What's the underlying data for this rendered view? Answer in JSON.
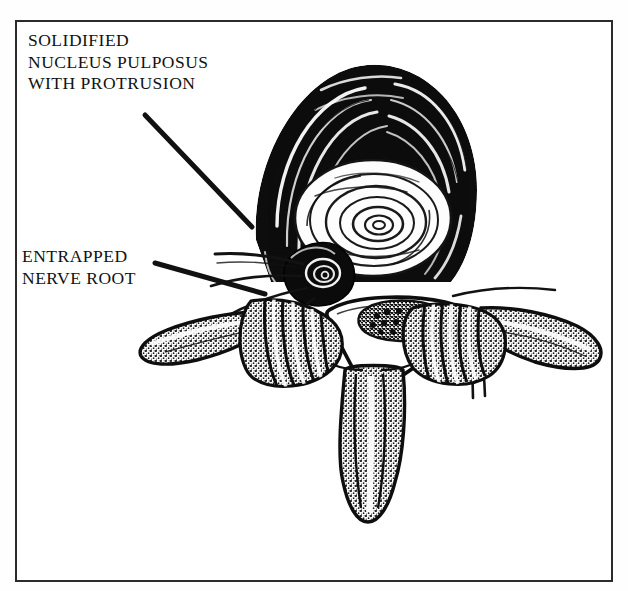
{
  "figure": {
    "type": "medical-illustration",
    "view": "superior / axial",
    "background_color": "#ffffff",
    "ink_color": "#111111",
    "border_color": "#2b2b2b",
    "has_border_frame": true
  },
  "labels": {
    "solidified": {
      "text": "SOLIDIFIED\nNUCLEUS PULPOSUS\nWITH PROTRUSION",
      "lines": [
        "SOLIDIFIED",
        "NUCLEUS PULPOSUS",
        "WITH PROTRUSION"
      ],
      "leader_from": [
        145,
        95
      ],
      "leader_to": [
        252,
        207
      ]
    },
    "entrapped": {
      "text": "ENTRAPPED\nNERVE ROOT",
      "lines": [
        "ENTRAPPED",
        "NERVE ROOT"
      ],
      "leader_from": [
        155,
        243
      ],
      "leader_to": [
        252,
        272
      ]
    }
  },
  "anatomy": {
    "annulus_fibrosus": "dark concentric laminated rings forming disc periphery",
    "nucleus_pulposus": "light concentric whorled center of disc",
    "protrusion": "rounded dark mass bulging posteriorly into canal",
    "cauda_equina": "stippled oval bundle of nerve roots within dural sac",
    "dural_sac": "triangular spinal canal outline",
    "transverse_process_left": "lateral elongated process on left",
    "transverse_process_right": "lateral elongated process on right",
    "lamina_left": "stippled posterior arch, left",
    "lamina_right": "stippled posterior arch, right",
    "spinous_process": "vertical stippled process extending inferiorly",
    "nerve_root_fibers": "fine radiating fibers emerging anterolaterally"
  }
}
